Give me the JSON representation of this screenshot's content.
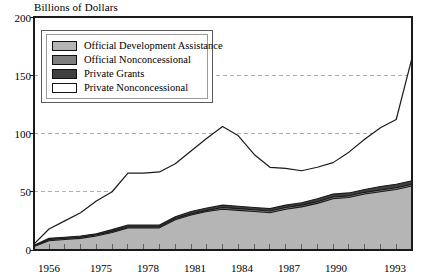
{
  "chart_data": {
    "type": "area",
    "title": "Billions of Dollars",
    "subtitle": "",
    "xlabel": "",
    "ylabel": "Billions of Dollars",
    "ylim": [
      0,
      200
    ],
    "yticks": [
      0,
      50,
      100,
      150,
      200
    ],
    "ytick_labels": [
      "0",
      "50",
      "100",
      "150",
      "200"
    ],
    "grid": true,
    "grid_style": "dashed-horizontal",
    "legend_position": "upper-left-inside",
    "x": [
      1956,
      1970,
      1971,
      1972,
      1973,
      1974,
      1975,
      1976,
      1977,
      1978,
      1979,
      1980,
      1981,
      1982,
      1983,
      1984,
      1985,
      1986,
      1987,
      1988,
      1989,
      1990,
      1991,
      1992,
      1993
    ],
    "xtick_labels": [
      "1956",
      "1975",
      "1978",
      "1981",
      "1984",
      "1987",
      "1990",
      "1993"
    ],
    "xtick_values": [
      1956,
      1975,
      1978,
      1981,
      1984,
      1987,
      1990,
      1993
    ],
    "stacked": true,
    "series": [
      {
        "name": "Official Development Assistance",
        "color": "#b5b5b5",
        "values": [
          3,
          8,
          9,
          10,
          12,
          15,
          19,
          19,
          19,
          26,
          30,
          33,
          35,
          34,
          33,
          32,
          35,
          37,
          40,
          44,
          45,
          48,
          50,
          52,
          55
        ]
      },
      {
        "name": "Official Nonconcessional",
        "color": "#7e7e7e",
        "values": [
          0.5,
          1,
          1,
          1,
          1,
          1,
          1,
          1,
          1,
          1,
          1,
          1,
          1.5,
          1.5,
          1.5,
          1.5,
          1.5,
          1.5,
          1.5,
          1.5,
          1.5,
          1.5,
          1.5,
          1.5,
          1.5
        ]
      },
      {
        "name": "Private Grants",
        "color": "#3f3f3f",
        "values": [
          0.5,
          1,
          1,
          1,
          1,
          1.5,
          1.5,
          1.5,
          1.5,
          1.5,
          2,
          2,
          2,
          2,
          2,
          2,
          2,
          2,
          2.5,
          2.5,
          2.5,
          2.5,
          3,
          3,
          3
        ]
      },
      {
        "name": "Private Nonconcessional",
        "color": "#ffffff",
        "values": [
          1,
          8,
          14,
          20,
          28,
          33,
          44,
          44,
          45,
          45,
          52,
          60,
          68,
          60,
          45,
          35,
          31,
          27,
          27,
          27,
          35,
          43,
          50,
          55,
          105
        ]
      }
    ],
    "total_line": [
      5,
      18,
      25,
      32,
      42,
      50,
      66,
      66,
      67,
      74,
      85,
      96,
      106,
      98,
      82,
      71,
      70,
      68,
      71,
      75,
      84,
      95,
      105,
      112,
      165
    ],
    "band_tops": {
      "oda": [
        3,
        8,
        9,
        10,
        12,
        15,
        19,
        19,
        19,
        26,
        30,
        33,
        35,
        34,
        33,
        32,
        35,
        37,
        40,
        44,
        45,
        48,
        50,
        52,
        55
      ],
      "official_nc": [
        3.5,
        9,
        10,
        11,
        13,
        16,
        20,
        20,
        20,
        27,
        31,
        34,
        36.5,
        35.5,
        34.5,
        33.5,
        36.5,
        38.5,
        41.5,
        45.5,
        46.5,
        49.5,
        51.5,
        53.5,
        56.5
      ],
      "private_g": [
        4,
        10,
        11,
        12,
        14,
        17.5,
        21.5,
        21.5,
        21.5,
        28.5,
        33,
        36,
        38.5,
        37.5,
        36.5,
        35.5,
        38.5,
        40.5,
        44,
        48,
        49,
        52,
        54.5,
        56.5,
        59.5
      ],
      "private_nc": [
        5,
        18,
        25,
        32,
        42,
        50,
        66,
        66,
        67,
        74,
        85,
        96,
        106,
        98,
        82,
        71,
        70,
        68,
        71,
        75,
        84,
        95,
        105,
        112,
        165
      ]
    }
  },
  "legend": {
    "items": [
      {
        "label": "Official Development Assistance",
        "color": "#b5b5b5"
      },
      {
        "label": "Official Nonconcessional",
        "color": "#7e7e7e"
      },
      {
        "label": "Private Grants",
        "color": "#3f3f3f"
      },
      {
        "label": "Private Nonconcessional",
        "color": "#ffffff"
      }
    ]
  },
  "axes": {
    "y_title": "Billions of Dollars",
    "y_labels": [
      "200",
      "150",
      "100",
      "50",
      "0"
    ],
    "x_labels": [
      "1956",
      "1975",
      "1978",
      "1981",
      "1984",
      "1987",
      "1990",
      "1993"
    ]
  },
  "colors": {
    "oda": "#b5b5b5",
    "official_nonconcessional": "#7e7e7e",
    "private_grants": "#3f3f3f",
    "private_nonconcessional": "#ffffff",
    "line": "#1a1a1a",
    "grid": "#9a9a9a",
    "frame": "#1a1a1a"
  }
}
